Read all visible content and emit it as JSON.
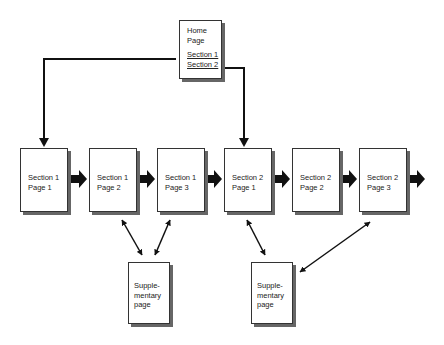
{
  "home": {
    "title_lines": [
      "Home",
      "Page"
    ],
    "links": [
      "Section 1",
      "Section 2"
    ]
  },
  "pages": [
    {
      "lines": [
        "Section 1",
        "Page 1"
      ]
    },
    {
      "lines": [
        "Section 1",
        "Page 2"
      ]
    },
    {
      "lines": [
        "Section 1",
        "Page 3"
      ]
    },
    {
      "lines": [
        "Section 2",
        "Page 1"
      ]
    },
    {
      "lines": [
        "Section 2",
        "Page 2"
      ]
    },
    {
      "lines": [
        "Section 2",
        "Page 3"
      ]
    }
  ],
  "supplementary": [
    {
      "lines": [
        "Supple-",
        "mentary",
        "page"
      ]
    },
    {
      "lines": [
        "Supple-",
        "mentary",
        "page"
      ]
    }
  ],
  "colors": {
    "line": "#111111",
    "shadow": "#666666",
    "border": "#333333"
  }
}
